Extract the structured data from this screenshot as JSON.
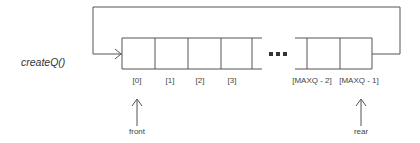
{
  "diagram": {
    "function_label": "createQ()",
    "cells": [
      {
        "index_label": "[0]"
      },
      {
        "index_label": "[1]"
      },
      {
        "index_label": "[2]"
      },
      {
        "index_label": "[3]"
      },
      {
        "index_label": "[MAXQ - 2]"
      },
      {
        "index_label": "[MAXQ - 1]"
      }
    ],
    "ellipsis": "• • •",
    "pointers": {
      "front": {
        "label": "front",
        "points_to": "[0]"
      },
      "rear": {
        "label": "rear",
        "points_to": "[MAXQ - 1]"
      }
    },
    "line_color": "#555555"
  }
}
